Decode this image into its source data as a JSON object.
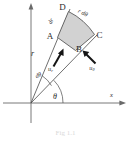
{
  "figure": {
    "caption": "Fig 1.1",
    "background_color": "#ffffff",
    "element_fill_color": "#d2d2d2",
    "line_color": "#4a4a4a",
    "axis_color": "#6a6a6a",
    "vector_color": "#151515"
  },
  "axes": {
    "x_axis_label": "x",
    "y_axis_label": "",
    "origin_label": ""
  },
  "points": {
    "a": "A",
    "b": "B",
    "c": "C",
    "d": "D"
  },
  "dimensions": {
    "radial_side": "dr",
    "arc_side": "r dθ",
    "radius": "r",
    "angle_increment": "dθ",
    "polar_angle": "θ"
  },
  "vectors": {
    "radial_base": "u",
    "radial_subscript": "r",
    "transverse_base": "u",
    "transverse_subscript": "θ"
  }
}
